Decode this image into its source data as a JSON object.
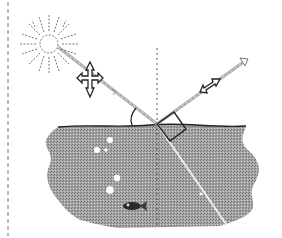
{
  "diagram": {
    "description": "Reflection of sunlight at a water surface showing polarization of incident and reflected light",
    "elements": [
      {
        "name": "sun",
        "icon": "sun-icon"
      },
      {
        "name": "incident-ray",
        "icon": "arrow-icon"
      },
      {
        "name": "incident-polarization-arrows",
        "icon": "cross-arrows-icon"
      },
      {
        "name": "reflected-ray",
        "icon": "arrow-icon"
      },
      {
        "name": "reflected-polarization-arrow",
        "icon": "double-arrow-icon"
      },
      {
        "name": "normal-line",
        "icon": "dashed-line"
      },
      {
        "name": "angle-arc",
        "icon": "arc-icon"
      },
      {
        "name": "right-angle-box",
        "icon": "right-angle-icon"
      },
      {
        "name": "refracted-ray",
        "icon": "line-icon"
      },
      {
        "name": "water-body",
        "icon": "water-icon"
      },
      {
        "name": "bubbles",
        "icon": "bubble-icon"
      },
      {
        "name": "fish",
        "icon": "fish-icon"
      },
      {
        "name": "left-border",
        "icon": "dashed-line"
      }
    ],
    "colors": {
      "water": "#9a9a9a",
      "line": "#222222",
      "ray": "#bdbdbd",
      "background": "#ffffff"
    }
  }
}
